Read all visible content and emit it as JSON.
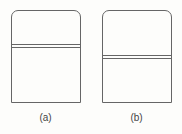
{
  "figure": {
    "panels": [
      {
        "label": "(a)",
        "divider_offset_px": 34
      },
      {
        "label": "(b)",
        "divider_offset_px": 45
      }
    ]
  }
}
